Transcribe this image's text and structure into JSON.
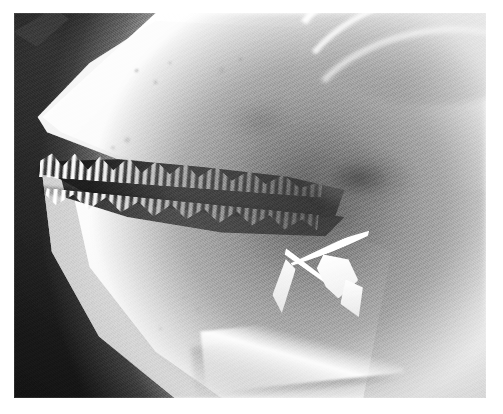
{
  "document": {
    "type": "radiograph",
    "modality": "X-ray",
    "view": "lateral",
    "subject": "fish head",
    "caption": ""
  },
  "canvas": {
    "width_px": 503,
    "height_px": 414,
    "paper_color": "#ffffff",
    "margin": {
      "left_px": 14,
      "top_px": 13,
      "right_px": 17,
      "bottom_px": 16
    }
  },
  "plate": {
    "left_px": 14,
    "top_px": 13,
    "width_px": 472,
    "height_px": 385,
    "background_color": "#171717",
    "bright_color": "#ffffff",
    "midtone_color": "#b4b4b4",
    "shadow_color": "#121212"
  },
  "anatomy": {
    "regions": [
      {
        "id": "background",
        "label": "unexposed film background",
        "tone": "dark",
        "position": "left and upper-left"
      },
      {
        "id": "snout",
        "label": "snout / rostrum",
        "tone": "bright",
        "position": "upper-left wedge"
      },
      {
        "id": "upper-jaw",
        "label": "upper jaw (maxilla/premaxilla)",
        "tone": "bright",
        "position": "upper-left to center"
      },
      {
        "id": "lower-jaw",
        "label": "lower jaw (mandible/dentary)",
        "tone": "bright",
        "position": "lower-left wedge"
      },
      {
        "id": "mouth-gape",
        "label": "open mouth gape",
        "tone": "dark",
        "position": "center-left band"
      },
      {
        "id": "teeth-upper",
        "label": "upper tooth row",
        "tone": "bright",
        "position": "along upper jaw margin"
      },
      {
        "id": "teeth-lower",
        "label": "lower tooth row",
        "tone": "bright",
        "position": "along lower jaw margin"
      },
      {
        "id": "buccal-cavity",
        "label": "buccal / pharyngeal cavity",
        "tone": "dark",
        "position": "center"
      },
      {
        "id": "gill-arches",
        "label": "gill arches / opercular plates",
        "tone": "bright",
        "position": "upper-right curved bands"
      },
      {
        "id": "branchiostegal-rays",
        "label": "branchiostegal rays / hyoid splinters",
        "tone": "bright",
        "position": "center-right"
      },
      {
        "id": "isthmus-keel",
        "label": "ventral keel / isthmus margin",
        "tone": "bright",
        "position": "lower-center diagonal"
      },
      {
        "id": "denticles",
        "label": "scattered bony denticles",
        "tone": "midtone",
        "position": "over jaw surfaces"
      }
    ],
    "tooth_rows": {
      "upper_count": 20,
      "lower_count": 19,
      "shape": "conical serrated"
    }
  },
  "render": {
    "grain": true,
    "vignette": true,
    "blur_px": 0.8
  }
}
